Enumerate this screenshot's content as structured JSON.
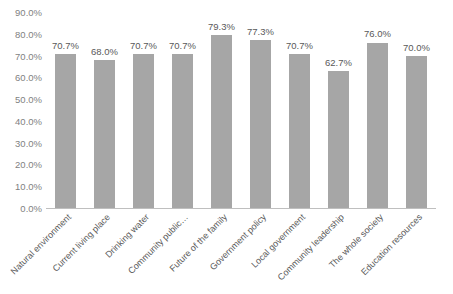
{
  "chart_data": {
    "type": "bar",
    "title": "",
    "xlabel": "",
    "ylabel": "",
    "categories": [
      "Natural environment",
      "Current living place",
      "Drinking water",
      "Community public…",
      "Future of the family",
      "Government policy",
      "Local government",
      "Community leadership",
      "The whole society",
      "Education resources"
    ],
    "values": [
      70.7,
      68.0,
      70.7,
      70.7,
      79.3,
      77.3,
      70.7,
      62.7,
      76.0,
      70.0
    ],
    "value_labels": [
      "70.7%",
      "68.0%",
      "70.7%",
      "70.7%",
      "79.3%",
      "77.3%",
      "70.7%",
      "62.7%",
      "76.0%",
      "70.0%"
    ],
    "ylim": [
      0,
      90
    ],
    "ytick_labels": [
      "90.0%",
      "80.0%",
      "70.0%",
      "60.0%",
      "50.0%",
      "40.0%",
      "30.0%",
      "20.0%",
      "10.0%",
      "0.0%"
    ],
    "ytick_values": [
      90,
      80,
      70,
      60,
      50,
      40,
      30,
      20,
      10,
      0
    ],
    "grid": false,
    "legend": "none",
    "bar_color": "#a6a6a6",
    "axis_color": "#bfbfbf",
    "label_color": "#7f7f7f"
  }
}
